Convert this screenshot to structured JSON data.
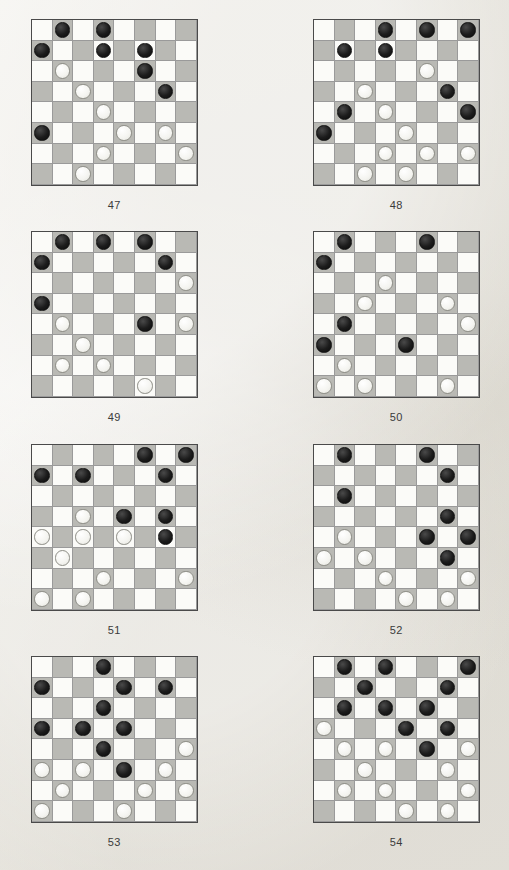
{
  "page": {
    "background_color": "#eceae4",
    "light_square_color": "#fbfbf8",
    "dark_square_color": "#b9b9b4",
    "black_piece_color": "#1c1c1c",
    "white_piece_color": "#f4f4f0",
    "board_border_color": "#4a4a4a"
  },
  "diagrams": [
    {
      "caption": "47",
      "left": 31,
      "top": 19,
      "rows": [
        [
          ".",
          "b",
          ".",
          "b",
          ".",
          ".",
          ".",
          "."
        ],
        [
          "b",
          ".",
          ".",
          "b",
          ".",
          "b",
          ".",
          "."
        ],
        [
          ".",
          "w",
          ".",
          ".",
          ".",
          "b",
          ".",
          "."
        ],
        [
          ".",
          ".",
          "w",
          ".",
          ".",
          ".",
          "b",
          "."
        ],
        [
          ".",
          ".",
          ".",
          "w",
          ".",
          ".",
          ".",
          "."
        ],
        [
          "b",
          ".",
          ".",
          ".",
          "w",
          ".",
          "w",
          "."
        ],
        [
          ".",
          ".",
          ".",
          "w",
          ".",
          ".",
          ".",
          "w"
        ],
        [
          ".",
          ".",
          "w",
          ".",
          ".",
          ".",
          ".",
          "."
        ]
      ]
    },
    {
      "caption": "48",
      "left": 313,
      "top": 19,
      "rows": [
        [
          ".",
          ".",
          ".",
          "b",
          ".",
          "b",
          ".",
          "b"
        ],
        [
          ".",
          "b",
          ".",
          "b",
          ".",
          ".",
          ".",
          "."
        ],
        [
          ".",
          ".",
          ".",
          ".",
          ".",
          "w",
          ".",
          "."
        ],
        [
          ".",
          ".",
          "w",
          ".",
          ".",
          ".",
          "b",
          "."
        ],
        [
          ".",
          "b",
          ".",
          "w",
          ".",
          ".",
          ".",
          "b"
        ],
        [
          "b",
          ".",
          ".",
          ".",
          "w",
          ".",
          ".",
          "."
        ],
        [
          ".",
          ".",
          ".",
          "w",
          ".",
          "w",
          ".",
          "w"
        ],
        [
          ".",
          ".",
          "w",
          ".",
          "w",
          ".",
          ".",
          "."
        ]
      ]
    },
    {
      "caption": "49",
      "left": 31,
      "top": 231,
      "rows": [
        [
          ".",
          "b",
          ".",
          "b",
          ".",
          "b",
          ".",
          "."
        ],
        [
          "b",
          ".",
          ".",
          ".",
          ".",
          ".",
          "b",
          "."
        ],
        [
          ".",
          ".",
          ".",
          ".",
          ".",
          ".",
          ".",
          "w"
        ],
        [
          "b",
          ".",
          ".",
          ".",
          ".",
          ".",
          ".",
          "."
        ],
        [
          ".",
          "w",
          ".",
          ".",
          ".",
          "b",
          ".",
          "w"
        ],
        [
          ".",
          ".",
          "w",
          ".",
          ".",
          ".",
          ".",
          "."
        ],
        [
          ".",
          "w",
          ".",
          "w",
          ".",
          ".",
          ".",
          "."
        ],
        [
          ".",
          ".",
          ".",
          ".",
          ".",
          "w",
          ".",
          "."
        ]
      ]
    },
    {
      "caption": "50",
      "left": 313,
      "top": 231,
      "rows": [
        [
          ".",
          "b",
          ".",
          ".",
          ".",
          "b",
          ".",
          "."
        ],
        [
          "b",
          ".",
          ".",
          ".",
          ".",
          ".",
          ".",
          "."
        ],
        [
          ".",
          ".",
          ".",
          "w",
          ".",
          ".",
          ".",
          "."
        ],
        [
          ".",
          ".",
          "w",
          ".",
          ".",
          ".",
          "w",
          "."
        ],
        [
          ".",
          "b",
          ".",
          ".",
          ".",
          ".",
          ".",
          "w"
        ],
        [
          "b",
          ".",
          ".",
          ".",
          "b",
          ".",
          ".",
          "."
        ],
        [
          ".",
          "w",
          ".",
          ".",
          ".",
          ".",
          ".",
          "."
        ],
        [
          "w",
          ".",
          "w",
          ".",
          ".",
          ".",
          "w",
          "."
        ]
      ]
    },
    {
      "caption": "51",
      "left": 31,
      "top": 444,
      "rows": [
        [
          ".",
          ".",
          ".",
          ".",
          ".",
          "b",
          ".",
          "b"
        ],
        [
          "b",
          ".",
          "b",
          ".",
          ".",
          ".",
          "b",
          "."
        ],
        [
          ".",
          ".",
          ".",
          ".",
          ".",
          ".",
          ".",
          "."
        ],
        [
          ".",
          ".",
          "w",
          ".",
          "b",
          ".",
          "b",
          "."
        ],
        [
          "w",
          ".",
          "w",
          ".",
          "w",
          ".",
          "b",
          "."
        ],
        [
          ".",
          "w",
          ".",
          ".",
          ".",
          ".",
          ".",
          "."
        ],
        [
          ".",
          ".",
          ".",
          "w",
          ".",
          ".",
          ".",
          "w"
        ],
        [
          "w",
          ".",
          "w",
          ".",
          ".",
          ".",
          ".",
          "."
        ]
      ]
    },
    {
      "caption": "52",
      "left": 313,
      "top": 444,
      "rows": [
        [
          ".",
          "b",
          ".",
          ".",
          ".",
          "b",
          ".",
          "."
        ],
        [
          ".",
          ".",
          ".",
          ".",
          ".",
          ".",
          "b",
          "."
        ],
        [
          ".",
          "b",
          ".",
          ".",
          ".",
          ".",
          ".",
          "."
        ],
        [
          ".",
          ".",
          ".",
          ".",
          ".",
          ".",
          "b",
          "."
        ],
        [
          ".",
          "w",
          ".",
          ".",
          ".",
          "b",
          ".",
          "b"
        ],
        [
          "w",
          ".",
          "w",
          ".",
          ".",
          ".",
          "b",
          "."
        ],
        [
          ".",
          ".",
          ".",
          "w",
          ".",
          ".",
          ".",
          "w"
        ],
        [
          ".",
          ".",
          ".",
          ".",
          "w",
          ".",
          "w",
          "."
        ]
      ]
    },
    {
      "caption": "53",
      "left": 31,
      "top": 656,
      "rows": [
        [
          ".",
          ".",
          ".",
          "b",
          ".",
          ".",
          ".",
          "."
        ],
        [
          "b",
          ".",
          ".",
          ".",
          "b",
          ".",
          "b",
          "."
        ],
        [
          ".",
          ".",
          ".",
          "b",
          ".",
          ".",
          ".",
          "."
        ],
        [
          "b",
          ".",
          "b",
          ".",
          "b",
          ".",
          ".",
          "."
        ],
        [
          ".",
          ".",
          ".",
          "b",
          ".",
          ".",
          ".",
          "w"
        ],
        [
          "w",
          ".",
          "w",
          ".",
          "b",
          ".",
          "w",
          "."
        ],
        [
          ".",
          "w",
          ".",
          ".",
          ".",
          "w",
          ".",
          "w"
        ],
        [
          "w",
          ".",
          ".",
          ".",
          "w",
          ".",
          ".",
          "."
        ]
      ]
    },
    {
      "caption": "54",
      "left": 313,
      "top": 656,
      "rows": [
        [
          ".",
          "b",
          ".",
          "b",
          ".",
          ".",
          ".",
          "b"
        ],
        [
          ".",
          ".",
          "b",
          ".",
          ".",
          ".",
          "b",
          "."
        ],
        [
          ".",
          "b",
          ".",
          "b",
          ".",
          "b",
          ".",
          "."
        ],
        [
          "w",
          ".",
          ".",
          ".",
          "b",
          ".",
          "b",
          "."
        ],
        [
          ".",
          "w",
          ".",
          "w",
          ".",
          "b",
          ".",
          "w"
        ],
        [
          ".",
          ".",
          "w",
          ".",
          ".",
          ".",
          "w",
          "."
        ],
        [
          ".",
          "w",
          ".",
          "w",
          ".",
          ".",
          ".",
          "w"
        ],
        [
          ".",
          ".",
          ".",
          ".",
          "w",
          ".",
          "w",
          "."
        ]
      ]
    }
  ]
}
